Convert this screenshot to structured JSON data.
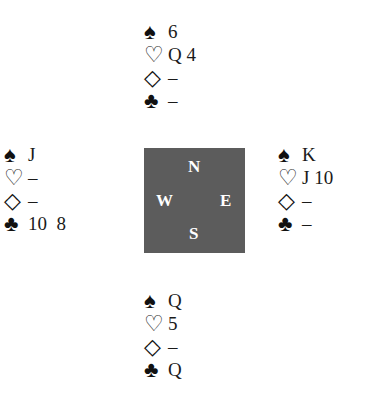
{
  "suit_symbols": {
    "spade": "♠",
    "heart": "♡",
    "diamond": "◇",
    "club": "♣"
  },
  "hands": {
    "north": {
      "spades": "6",
      "hearts": "Q 4",
      "diamonds": "–",
      "clubs": "–"
    },
    "west": {
      "spades": "J",
      "hearts": "–",
      "diamonds": "–",
      "clubs": "10  8"
    },
    "east": {
      "spades": "K",
      "hearts": "J 10",
      "diamonds": "–",
      "clubs": "–"
    },
    "south": {
      "spades": "Q",
      "hearts": "5",
      "diamonds": "–",
      "clubs": "Q"
    }
  },
  "compass": {
    "n": "N",
    "s": "S",
    "w": "W",
    "e": "E",
    "color": "#5c5c5c"
  }
}
